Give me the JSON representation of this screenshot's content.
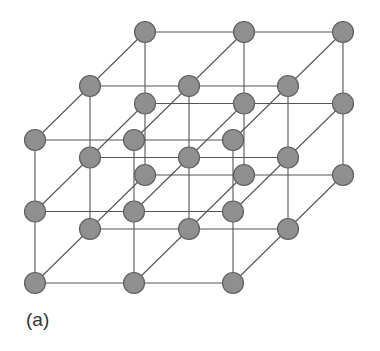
{
  "figure": {
    "label": "(a)",
    "lattice": {
      "nx": 3,
      "ny": 3,
      "nz": 3,
      "origin": [
        35,
        283
      ],
      "dx": 99,
      "dy": -71.5,
      "depth_offset": [
        55,
        -54
      ],
      "atom_radius": 10.5
    },
    "colors": {
      "atom_fill": "#8f8f8f",
      "atom_stroke": "#5e5e5e",
      "bond": "#555555",
      "background": "#ffffff"
    }
  }
}
